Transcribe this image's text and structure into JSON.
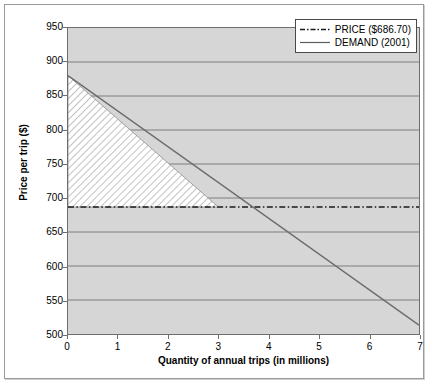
{
  "chart_data": {
    "type": "line",
    "title": "",
    "xlabel": "Quantity of annual trips (in millions)",
    "ylabel": "Price per trip ($)",
    "xlim": [
      0,
      7
    ],
    "ylim": [
      500,
      950
    ],
    "xticks": [
      "0",
      "1",
      "2",
      "3",
      "4",
      "5",
      "6",
      "7"
    ],
    "yticks": [
      "500",
      "550",
      "600",
      "650",
      "700",
      "750",
      "800",
      "850",
      "900",
      "950"
    ],
    "grid": "horizontal",
    "legend_position": "top-right",
    "series": [
      {
        "name": "PRICE ($686.70)",
        "style": "dash-dot",
        "color": "#1a1a1a",
        "type": "horizontal-line",
        "value": 686.7,
        "x": [
          0,
          7
        ],
        "values": [
          686.7,
          686.7
        ]
      },
      {
        "name": "DEMAND (2001)",
        "style": "solid",
        "color": "#6b6b6b",
        "type": "line",
        "x": [
          0,
          7
        ],
        "values": [
          880,
          513
        ]
      }
    ],
    "shaded_region": {
      "name": "consumer-surplus",
      "fill": "diagonal-hatch",
      "fill_color": "#ffffff",
      "points": [
        [
          0,
          880
        ],
        [
          0,
          686.7
        ],
        [
          3,
          686.7
        ]
      ]
    },
    "colors": {
      "plot_background": "#d6d6d6",
      "gridline": "#7d7d7d",
      "axis": "#6e6e6e",
      "frame": "#9a9a9a",
      "demand_line": "#6b6b6b",
      "price_line": "#1a1a1a"
    }
  },
  "legend": {
    "items": [
      {
        "label": "PRICE ($686.70)",
        "key": "dash-dot-line-key"
      },
      {
        "label": "DEMAND (2001)",
        "key": "solid-line-key"
      }
    ]
  },
  "axes": {
    "x_title": "Quantity of annual trips (in millions)",
    "y_title": "Price per trip ($)"
  }
}
